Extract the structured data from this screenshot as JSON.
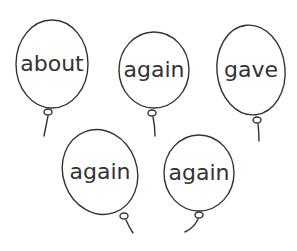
{
  "worksheet": {
    "balloons": [
      {
        "word": "about",
        "cx": 52,
        "cy": 64,
        "rx": 36,
        "ry": 44,
        "rotate": 0,
        "knot": [
          48,
          112
        ],
        "string": "M48,116 Q46,126 44,136"
      },
      {
        "word": "again",
        "cx": 154,
        "cy": 70,
        "rx": 35,
        "ry": 38,
        "rotate": 0,
        "knot": [
          152,
          113
        ],
        "string": "M153,117 Q155,126 155,136"
      },
      {
        "word": "gave",
        "cx": 251,
        "cy": 70,
        "rx": 34,
        "ry": 45,
        "rotate": -6,
        "knot": [
          257,
          120
        ],
        "string": "M258,124 Q259,132 259,141"
      },
      {
        "word": "again",
        "cx": 100,
        "cy": 172,
        "rx": 37,
        "ry": 43,
        "rotate": -20,
        "knot": [
          124,
          216
        ],
        "string": "M126,220 Q129,227 133,233"
      },
      {
        "word": "again",
        "cx": 199,
        "cy": 173,
        "rx": 35,
        "ry": 38,
        "rotate": 0,
        "knot": [
          199,
          215
        ],
        "string": "M198,219 Q194,228 185,232"
      }
    ],
    "colors": {
      "ink": "#333333",
      "background": "#ffffff"
    }
  }
}
